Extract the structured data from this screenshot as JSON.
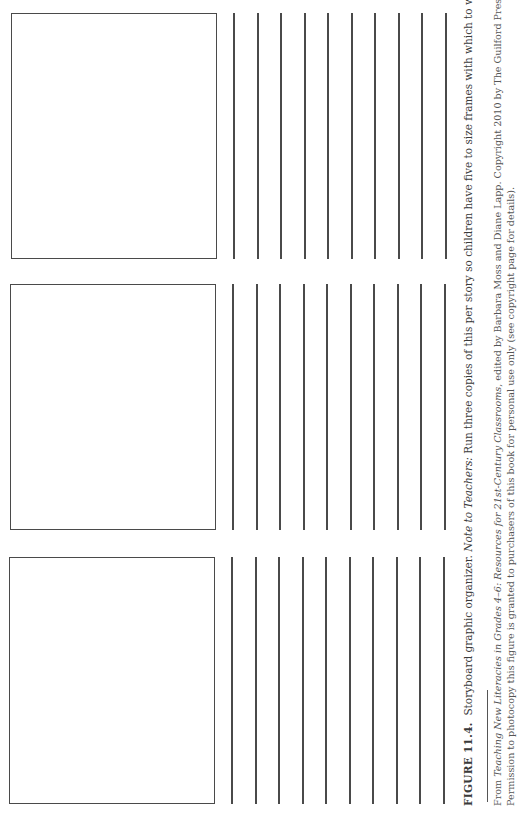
{
  "document": {
    "frames": [
      {
        "label": "storyboard-frame-1",
        "left": 11,
        "top": 13,
        "width": 206,
        "height": 246
      },
      {
        "label": "storyboard-frame-2",
        "left": 10,
        "top": 284,
        "width": 206,
        "height": 246
      },
      {
        "label": "storyboard-frame-3",
        "left": 9,
        "top": 557,
        "width": 206,
        "height": 247
      }
    ],
    "writing_lines_x": [
      233,
      257,
      280,
      304,
      327,
      351,
      374,
      398,
      421,
      445
    ],
    "caption": {
      "figure_label": "FIGURE 11.4.",
      "title": "Storyboard graphic organizer.",
      "note_label": "Note to Teachers:",
      "note_text": "Run three copies of this per story so children have five to size frames with which to work."
    },
    "footnote": {
      "line1_prefix": "From ",
      "book_title": "Teaching New Literacies in Grades 4–6: Resources for 21st-Century Classrooms",
      "line1_suffix": ", edited by Barbara Moss and Diane Lapp. Copyright 2010 by The Guilford Press.",
      "line2": "Permission to photocopy this figure is granted to purchasers of this book for personal use only (see copyright page for details)."
    }
  }
}
